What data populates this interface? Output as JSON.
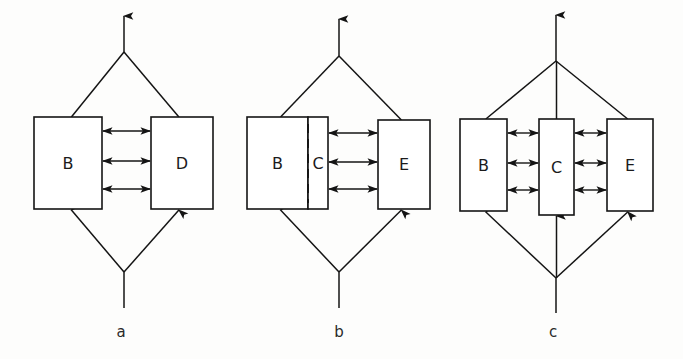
{
  "figure": {
    "background_color": "#fdfdfc",
    "line_color": "#141414",
    "box_fill": "#ffffff",
    "panels": [
      {
        "caption": "a",
        "caption_x": 121,
        "caption_y": 332,
        "apex_top_x": 124,
        "apex_top_y": 52,
        "arrow_top_tip_y": 16,
        "apex_bottom_x": 124,
        "apex_bottom_y": 272,
        "stem_bottom_y": 308,
        "boxes": [
          {
            "label": "B",
            "x": 34,
            "y": 117,
            "w": 68,
            "h": 92
          },
          {
            "label": "D",
            "x": 151,
            "y": 117,
            "w": 62,
            "h": 92
          }
        ],
        "divider": null,
        "flows": [
          {
            "from_x": 102,
            "to_x": 151,
            "y": 131,
            "double": true
          },
          {
            "from_x": 102,
            "to_x": 151,
            "y": 161,
            "double": true
          },
          {
            "from_x": 102,
            "to_x": 151,
            "y": 189,
            "double": true
          }
        ],
        "center_stem_to_box": false
      },
      {
        "caption": "b",
        "caption_x": 339,
        "caption_y": 332,
        "apex_top_x": 339,
        "apex_top_y": 56,
        "arrow_top_tip_y": 19,
        "apex_bottom_x": 339,
        "apex_bottom_y": 272,
        "stem_bottom_y": 308,
        "boxes": [
          {
            "label": "B",
            "x": 247,
            "y": 117,
            "w": 61,
            "h": 92
          },
          {
            "label": "C",
            "x": 308,
            "y": 117,
            "w": 20,
            "h": 92
          },
          {
            "label": "E",
            "x": 378,
            "y": 120,
            "w": 52,
            "h": 89
          }
        ],
        "divider": {
          "x": 308,
          "y_top": 124,
          "y_bottom": 203
        },
        "flows": [
          {
            "from_x": 328,
            "to_x": 378,
            "y": 133,
            "double": true
          },
          {
            "from_x": 328,
            "to_x": 378,
            "y": 162,
            "double": true
          },
          {
            "from_x": 328,
            "to_x": 378,
            "y": 189,
            "double": true
          }
        ],
        "center_stem_to_box": false
      },
      {
        "caption": "c",
        "caption_x": 553,
        "caption_y": 332,
        "apex_top_x": 556,
        "apex_top_y": 61,
        "arrow_top_tip_y": 15,
        "apex_bottom_x": 556,
        "apex_bottom_y": 278,
        "stem_bottom_y": 313,
        "boxes": [
          {
            "label": "B",
            "x": 460,
            "y": 119,
            "w": 47,
            "h": 92
          },
          {
            "label": "C",
            "x": 539,
            "y": 119,
            "w": 35,
            "h": 96
          },
          {
            "label": "E",
            "x": 607,
            "y": 119,
            "w": 46,
            "h": 92
          }
        ],
        "divider": null,
        "flows": [
          {
            "from_x": 507,
            "to_x": 539,
            "y": 133,
            "double": true
          },
          {
            "from_x": 507,
            "to_x": 539,
            "y": 163,
            "double": true
          },
          {
            "from_x": 507,
            "to_x": 539,
            "y": 190,
            "double": true
          },
          {
            "from_x": 574,
            "to_x": 607,
            "y": 133,
            "double": true
          },
          {
            "from_x": 574,
            "to_x": 607,
            "y": 163,
            "double": true
          },
          {
            "from_x": 574,
            "to_x": 607,
            "y": 190,
            "double": true
          }
        ],
        "center_stem_to_box": true,
        "center_box_index": 1
      }
    ]
  }
}
